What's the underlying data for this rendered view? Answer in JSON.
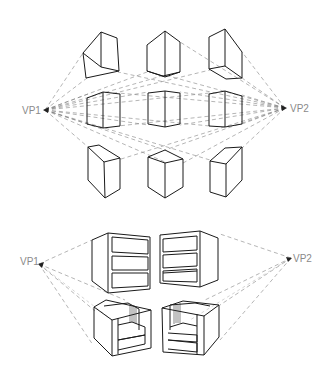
{
  "figure": {
    "top_section": {
      "vanishing_points": [
        {
          "label": "VP1",
          "x": 45,
          "y": 110
        },
        {
          "label": "VP2",
          "x": 285,
          "y": 108
        }
      ],
      "boxes": [
        {
          "row": "above",
          "col": "left"
        },
        {
          "row": "above",
          "col": "center"
        },
        {
          "row": "above",
          "col": "right"
        },
        {
          "row": "middle",
          "col": "left"
        },
        {
          "row": "middle",
          "col": "center"
        },
        {
          "row": "middle",
          "col": "right"
        },
        {
          "row": "below",
          "col": "left"
        },
        {
          "row": "below",
          "col": "center"
        },
        {
          "row": "below",
          "col": "right"
        }
      ]
    },
    "bottom_section": {
      "vanishing_points": [
        {
          "label": "VP1",
          "x": 39,
          "y": 264
        },
        {
          "label": "VP2",
          "x": 291,
          "y": 258
        }
      ],
      "objects": [
        {
          "type": "cabinet",
          "drawers": 3,
          "side": "left"
        },
        {
          "type": "cabinet",
          "drawers": 3,
          "side": "right"
        },
        {
          "type": "armchair",
          "side": "left"
        },
        {
          "type": "armchair",
          "side": "right"
        }
      ]
    }
  },
  "labels": {
    "top_vp1": "VP1",
    "top_vp2": "VP2",
    "bottom_vp1": "VP1",
    "bottom_vp2": "VP2"
  },
  "colors": {
    "line": "#1a1a1a",
    "guide": "#7a7a7a",
    "label": "#8a8a8a",
    "background": "#ffffff"
  }
}
